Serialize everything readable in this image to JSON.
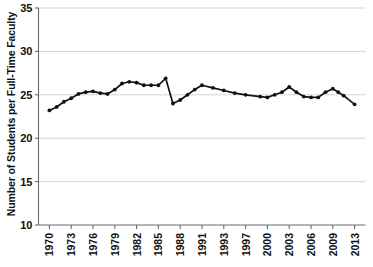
{
  "chart_data": {
    "type": "line",
    "title": "",
    "xlabel": "",
    "ylabel": "Number of Students per Full-Time Faculty",
    "ylim": [
      10,
      35
    ],
    "ytick_labels": [
      "35",
      "30",
      "25",
      "20",
      "15",
      "10"
    ],
    "ytick_values": [
      35,
      30,
      25,
      20,
      15,
      10
    ],
    "xtick_labels": [
      "1970",
      "1973",
      "1976",
      "1979",
      "1982",
      "1985",
      "1988",
      "1991",
      "1993",
      "1997",
      "2000",
      "2003",
      "2006",
      "2009",
      "2013"
    ],
    "grid": "horizontal",
    "legend": "none",
    "markers": true,
    "line_color": "#111111",
    "grid_color": "#c9c9c9",
    "axis_color": "#6b6b6b",
    "x": [
      1970,
      1971,
      1972,
      1973,
      1974,
      1975,
      1976,
      1977,
      1978,
      1979,
      1980,
      1981,
      1982,
      1983,
      1984,
      1985,
      1986,
      1987,
      1988,
      1989,
      1990,
      1991,
      1992,
      1993,
      1995,
      1997,
      1999,
      2000,
      2001,
      2002,
      2003,
      2004,
      2005,
      2006,
      2007,
      2008,
      2009,
      2010,
      2011,
      2013
    ],
    "values": [
      23.2,
      23.6,
      24.2,
      24.6,
      25.1,
      25.3,
      25.4,
      25.2,
      25.1,
      25.6,
      26.3,
      26.5,
      26.4,
      26.1,
      26.1,
      26.1,
      26.9,
      24.0,
      24.4,
      25.0,
      25.6,
      26.1,
      25.8,
      25.5,
      25.2,
      25.0,
      24.8,
      24.7,
      25.0,
      25.3,
      25.9,
      25.3,
      24.8,
      24.7,
      24.7,
      25.3,
      25.7,
      25.3,
      24.9,
      23.9
    ]
  }
}
